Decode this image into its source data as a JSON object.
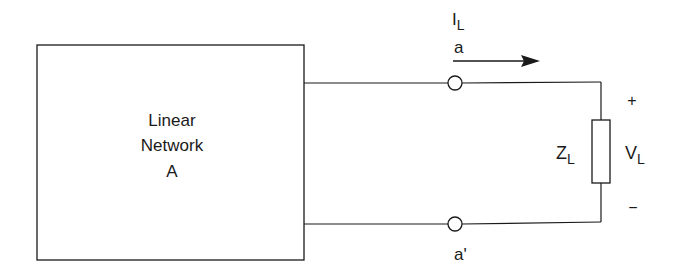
{
  "diagram": {
    "network": {
      "line1": "Linear",
      "line2": "Network",
      "line3": "A"
    },
    "current": {
      "symbol": "I",
      "subscript": "L"
    },
    "terminal_top": "a",
    "terminal_bottom": "a'",
    "load": {
      "symbol": "Z",
      "subscript": "L"
    },
    "voltage": {
      "symbol": "V",
      "subscript": "L"
    },
    "polarity_plus": "+",
    "polarity_minus": "−",
    "colors": {
      "stroke": "#1a1a1a",
      "background": "#ffffff"
    }
  }
}
